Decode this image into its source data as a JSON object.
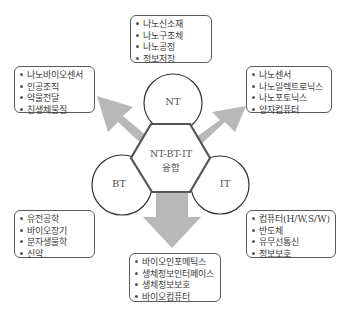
{
  "center": {
    "title_line1": "NT-BT-IT",
    "title_line2": "융합"
  },
  "circles": {
    "nt": "NT",
    "bt": "BT",
    "it": "IT"
  },
  "boxes": {
    "top": {
      "items": [
        "나노신소재",
        "나노구조체",
        "나노공정",
        "정보저장"
      ]
    },
    "left_top": {
      "items": [
        "나노바이오센서",
        "인공조직",
        "약물전달",
        "친생체물질"
      ]
    },
    "right_top": {
      "items": [
        "나노센서",
        "나노일렉트로닉스",
        "나노포토닉스",
        "양자컴퓨터"
      ]
    },
    "left_bottom": {
      "items": [
        "유전공학",
        "바이오장기",
        "분자생물학",
        "신약"
      ]
    },
    "right_bottom": {
      "items": [
        "컴퓨터(H/W,S/W)",
        "반도체",
        "유무선통신",
        "정보보호"
      ]
    },
    "bottom": {
      "items": [
        "바이오인포메틱스",
        "생체정보인터페이스",
        "생체정보보호",
        "바이오컴퓨터"
      ]
    }
  },
  "colors": {
    "arrow": "#b8b8b8",
    "outline": "#3a3a3a",
    "hexagon_border": "#555555"
  }
}
